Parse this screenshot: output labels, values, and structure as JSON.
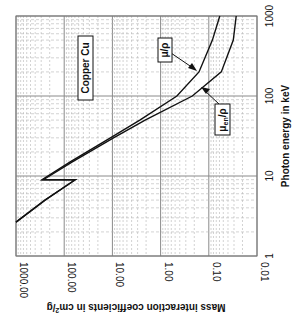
{
  "chart_data": {
    "type": "line",
    "title": "",
    "orientation": "rotated 90° clockwise (energy axis vertical, coefficient axis horizontal)",
    "xlabel": "Photon energy in keV",
    "ylabel": "Mass interaction coefficients in cm²/g",
    "x_scale": "log",
    "y_scale": "log",
    "xlim": [
      1,
      1000
    ],
    "ylim": [
      0.01,
      1000
    ],
    "x_ticks": [
      "1",
      "10",
      "100",
      "1000"
    ],
    "y_ticks": [
      "1000.00",
      "100.00",
      "10.00",
      "1.00",
      "0.10",
      "0.01"
    ],
    "grid": true,
    "annotations": [
      "Copper Cu",
      "μ/ρ",
      "μ_en/ρ"
    ],
    "series": [
      {
        "name": "μ/ρ",
        "x": [
          2.65,
          5,
          8.97,
          8.98,
          15,
          30,
          50,
          100,
          200,
          500,
          1000
        ],
        "y": [
          1000,
          250,
          59,
          290,
          75,
          11,
          2.7,
          0.46,
          0.16,
          0.084,
          0.059
        ]
      },
      {
        "name": "μ_en/ρ",
        "x": [
          2.65,
          5,
          8.97,
          8.98,
          15,
          30,
          50,
          100,
          200,
          500,
          1000
        ],
        "y": [
          1000,
          250,
          59,
          270,
          68,
          9.5,
          2.1,
          0.22,
          0.055,
          0.031,
          0.027
        ]
      }
    ]
  },
  "labels": {
    "material": "Copper Cu",
    "mu_rho": "μ/ρ",
    "mu_en_main": "μ",
    "mu_en_sub": "en",
    "mu_en_tail": "/ρ",
    "x_axis_title": "Photon energy in keV",
    "y_axis_title": "Mass interaction coefficients in cm",
    "y_axis_sup": "2",
    "y_axis_tail": "/g"
  },
  "ticks": {
    "energy": [
      "1",
      "10",
      "100",
      "1000"
    ],
    "coef": [
      "1000.00",
      "100.00",
      "10.00",
      "1.00",
      "0.10",
      "0.01"
    ]
  },
  "colors": {
    "curve": "#111111",
    "grid_major": "#8a8a8a",
    "grid_minor": "#b5b5b5",
    "frame": "#666666"
  }
}
